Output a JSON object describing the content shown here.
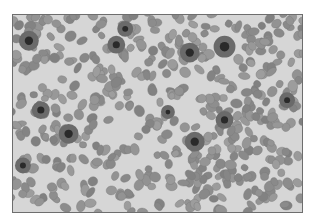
{
  "image": {
    "subject": "blood smear micrograph",
    "style": "grayscale",
    "colors": {
      "background": "#d6d6d6",
      "cell": "#8e8e8e",
      "cell_edge": "#7a7a7a",
      "nucleus": "#2a2a2a",
      "border": "#6e6e6e"
    },
    "nuclei": [
      {
        "x": 125,
        "y": 28,
        "r": 5
      },
      {
        "x": 116,
        "y": 44,
        "r": 6
      },
      {
        "x": 28,
        "y": 40,
        "r": 7
      },
      {
        "x": 190,
        "y": 52,
        "r": 7
      },
      {
        "x": 225,
        "y": 46,
        "r": 8
      },
      {
        "x": 168,
        "y": 112,
        "r": 4
      },
      {
        "x": 40,
        "y": 110,
        "r": 6
      },
      {
        "x": 68,
        "y": 134,
        "r": 7
      },
      {
        "x": 225,
        "y": 120,
        "r": 6
      },
      {
        "x": 195,
        "y": 142,
        "r": 7
      },
      {
        "x": 22,
        "y": 166,
        "r": 5
      },
      {
        "x": 288,
        "y": 100,
        "r": 5
      }
    ]
  }
}
